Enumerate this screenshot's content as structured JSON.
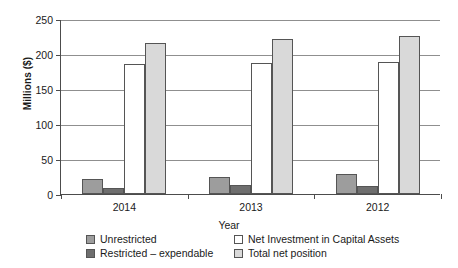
{
  "chart_data": {
    "type": "bar",
    "title": "",
    "xlabel": "Year",
    "ylabel": "Millions ($)",
    "categories": [
      "2014",
      "2013",
      "2012"
    ],
    "ylim": [
      0,
      250
    ],
    "yticks": [
      0,
      50,
      100,
      150,
      200,
      250
    ],
    "ytick_labels": [
      "0",
      "50",
      "100",
      "150",
      "200",
      "250"
    ],
    "grid": true,
    "legend_position": "bottom",
    "series": [
      {
        "name": "Unrestricted",
        "color": "#9d9d9d",
        "values": [
          21,
          25,
          28
        ]
      },
      {
        "name": "Restricted – expendable",
        "color": "#6e6e6e",
        "values": [
          9,
          13,
          11
        ]
      },
      {
        "name": "Net Investment in Capital Assets",
        "color": "#ffffff",
        "values": [
          186,
          187,
          189
        ]
      },
      {
        "name": "Total net position",
        "color": "#d9d9d9",
        "values": [
          216,
          221,
          226
        ]
      }
    ]
  },
  "axes": {
    "y_title": "Millions ($)",
    "x_title": "Year"
  },
  "legend": {
    "entries": [
      {
        "label": "Unrestricted",
        "swatch": "unrestricted"
      },
      {
        "label": "Net Investment in Capital Assets",
        "swatch": "net-investment"
      },
      {
        "label": "Restricted – expendable",
        "swatch": "restricted"
      },
      {
        "label": "Total net position",
        "swatch": "total-net-position"
      }
    ]
  },
  "ticks": {
    "y": [
      "250",
      "200",
      "150",
      "100",
      "50",
      "0"
    ],
    "x": [
      "2014",
      "2013",
      "2012"
    ]
  }
}
